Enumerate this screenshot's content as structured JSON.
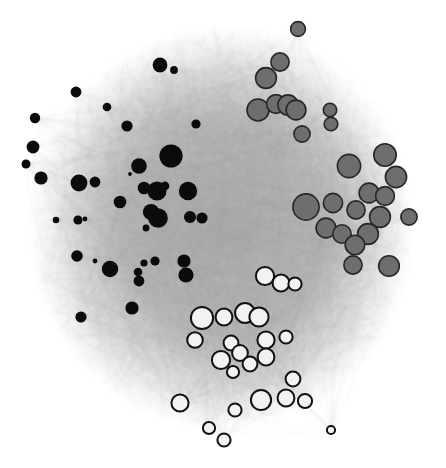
{
  "figure": {
    "title": "",
    "type": "network-graph",
    "width": 446,
    "height": 468,
    "background_color": "#ffffff"
  },
  "chart_data": {
    "type": "scatter",
    "title": "",
    "subtitle": "",
    "xlabel": "",
    "ylabel": "",
    "grid": false,
    "legend_position": "none",
    "xlim": [
      0,
      446
    ],
    "ylim": [
      0,
      468
    ],
    "layout": "force-directed",
    "communities": [
      {
        "id": "black",
        "name": "Community A",
        "fill": "#0b0b0b",
        "stroke": "#0b0b0b",
        "stroke_width": 0,
        "node_count": 52,
        "region": "left"
      },
      {
        "id": "gray",
        "name": "Community B",
        "fill": "#6e6e6e",
        "stroke": "#262626",
        "stroke_width": 1.6,
        "node_count": 36,
        "region": "upper-right"
      },
      {
        "id": "white",
        "name": "Community C",
        "fill": "#f2f2f2",
        "stroke": "#111111",
        "stroke_width": 2,
        "node_count": 40,
        "region": "bottom"
      }
    ],
    "edges": {
      "color": "#9a9a9a",
      "opacity": 0.1,
      "width": 0.45,
      "count": 2400,
      "style": "curved-arcs",
      "core_density_color": "#b2b2b2"
    },
    "nodes": [
      {
        "x": 160,
        "y": 65,
        "r": 7.4,
        "g": "black"
      },
      {
        "x": 174,
        "y": 70,
        "r": 3.9,
        "g": "black"
      },
      {
        "x": 76,
        "y": 92,
        "r": 5.4,
        "g": "black"
      },
      {
        "x": 35,
        "y": 118,
        "r": 5.2,
        "g": "black"
      },
      {
        "x": 107,
        "y": 107,
        "r": 4.3,
        "g": "black"
      },
      {
        "x": 127,
        "y": 126,
        "r": 5.6,
        "g": "black"
      },
      {
        "x": 196,
        "y": 124,
        "r": 4.6,
        "g": "black"
      },
      {
        "x": 33,
        "y": 147,
        "r": 6.4,
        "g": "black"
      },
      {
        "x": 26,
        "y": 164,
        "r": 4.5,
        "g": "black"
      },
      {
        "x": 171,
        "y": 156,
        "r": 11.6,
        "g": "black"
      },
      {
        "x": 139,
        "y": 166,
        "r": 7.8,
        "g": "black"
      },
      {
        "x": 130,
        "y": 174,
        "r": 1.9,
        "g": "black"
      },
      {
        "x": 41,
        "y": 178,
        "r": 6.6,
        "g": "black"
      },
      {
        "x": 79,
        "y": 183,
        "r": 8.4,
        "g": "black"
      },
      {
        "x": 95,
        "y": 182,
        "r": 5.4,
        "g": "black"
      },
      {
        "x": 144,
        "y": 188,
        "r": 6.3,
        "g": "black"
      },
      {
        "x": 157,
        "y": 191,
        "r": 9.6,
        "g": "black"
      },
      {
        "x": 165,
        "y": 186,
        "r": 4.4,
        "g": "black"
      },
      {
        "x": 188,
        "y": 191,
        "r": 9.2,
        "g": "black"
      },
      {
        "x": 120,
        "y": 202,
        "r": 6.3,
        "g": "black"
      },
      {
        "x": 151,
        "y": 212,
        "r": 8.1,
        "g": "black"
      },
      {
        "x": 158,
        "y": 218,
        "r": 9.8,
        "g": "black"
      },
      {
        "x": 190,
        "y": 217,
        "r": 6.0,
        "g": "black"
      },
      {
        "x": 202,
        "y": 218,
        "r": 5.6,
        "g": "black"
      },
      {
        "x": 56,
        "y": 220,
        "r": 3.3,
        "g": "black"
      },
      {
        "x": 78,
        "y": 220,
        "r": 4.6,
        "g": "black"
      },
      {
        "x": 85,
        "y": 219,
        "r": 2.4,
        "g": "black"
      },
      {
        "x": 146,
        "y": 228,
        "r": 3.4,
        "g": "black"
      },
      {
        "x": 77,
        "y": 256,
        "r": 5.8,
        "g": "black"
      },
      {
        "x": 95,
        "y": 261,
        "r": 2.4,
        "g": "black"
      },
      {
        "x": 110,
        "y": 269,
        "r": 8.2,
        "g": "black"
      },
      {
        "x": 138,
        "y": 272,
        "r": 4.3,
        "g": "black"
      },
      {
        "x": 144,
        "y": 263,
        "r": 3.6,
        "g": "black"
      },
      {
        "x": 155,
        "y": 261,
        "r": 4.6,
        "g": "black"
      },
      {
        "x": 139,
        "y": 281,
        "r": 5.4,
        "g": "black"
      },
      {
        "x": 184,
        "y": 261,
        "r": 6.6,
        "g": "black"
      },
      {
        "x": 186,
        "y": 275,
        "r": 7.6,
        "g": "black"
      },
      {
        "x": 132,
        "y": 308,
        "r": 6.6,
        "g": "black"
      },
      {
        "x": 81,
        "y": 317,
        "r": 5.6,
        "g": "black"
      },
      {
        "x": 298,
        "y": 29,
        "r": 7.4,
        "g": "gray"
      },
      {
        "x": 280,
        "y": 62,
        "r": 9.1,
        "g": "gray"
      },
      {
        "x": 266,
        "y": 78,
        "r": 10.4,
        "g": "gray"
      },
      {
        "x": 258,
        "y": 110,
        "r": 11.0,
        "g": "gray"
      },
      {
        "x": 276,
        "y": 104,
        "r": 9.4,
        "g": "gray"
      },
      {
        "x": 288,
        "y": 105,
        "r": 10.1,
        "g": "gray"
      },
      {
        "x": 296,
        "y": 110,
        "r": 9.9,
        "g": "gray"
      },
      {
        "x": 330,
        "y": 110,
        "r": 6.7,
        "g": "gray"
      },
      {
        "x": 331,
        "y": 124,
        "r": 6.8,
        "g": "gray"
      },
      {
        "x": 302,
        "y": 134,
        "r": 8.1,
        "g": "gray"
      },
      {
        "x": 385,
        "y": 155,
        "r": 11.2,
        "g": "gray"
      },
      {
        "x": 349,
        "y": 166,
        "r": 11.6,
        "g": "gray"
      },
      {
        "x": 396,
        "y": 177,
        "r": 10.6,
        "g": "gray"
      },
      {
        "x": 369,
        "y": 193,
        "r": 9.9,
        "g": "gray"
      },
      {
        "x": 385,
        "y": 196,
        "r": 9.4,
        "g": "gray"
      },
      {
        "x": 306,
        "y": 207,
        "r": 13.1,
        "g": "gray"
      },
      {
        "x": 333,
        "y": 203,
        "r": 9.6,
        "g": "gray"
      },
      {
        "x": 356,
        "y": 210,
        "r": 9.1,
        "g": "gray"
      },
      {
        "x": 380,
        "y": 217,
        "r": 10.4,
        "g": "gray"
      },
      {
        "x": 409,
        "y": 217,
        "r": 8.1,
        "g": "gray"
      },
      {
        "x": 326,
        "y": 228,
        "r": 9.9,
        "g": "gray"
      },
      {
        "x": 342,
        "y": 234,
        "r": 9.2,
        "g": "gray"
      },
      {
        "x": 368,
        "y": 234,
        "r": 10.4,
        "g": "gray"
      },
      {
        "x": 355,
        "y": 245,
        "r": 9.8,
        "g": "gray"
      },
      {
        "x": 353,
        "y": 265,
        "r": 9.1,
        "g": "gray"
      },
      {
        "x": 389,
        "y": 266,
        "r": 10.3,
        "g": "gray"
      },
      {
        "x": 265,
        "y": 276,
        "r": 9.1,
        "g": "white"
      },
      {
        "x": 281,
        "y": 283,
        "r": 8.4,
        "g": "white"
      },
      {
        "x": 295,
        "y": 284,
        "r": 6.6,
        "g": "white"
      },
      {
        "x": 202,
        "y": 318,
        "r": 11.1,
        "g": "white"
      },
      {
        "x": 224,
        "y": 317,
        "r": 8.4,
        "g": "white"
      },
      {
        "x": 245,
        "y": 313,
        "r": 9.9,
        "g": "white"
      },
      {
        "x": 259,
        "y": 317,
        "r": 9.6,
        "g": "white"
      },
      {
        "x": 195,
        "y": 340,
        "r": 7.8,
        "g": "white"
      },
      {
        "x": 231,
        "y": 343,
        "r": 7.4,
        "g": "white"
      },
      {
        "x": 266,
        "y": 340,
        "r": 8.6,
        "g": "white"
      },
      {
        "x": 286,
        "y": 337,
        "r": 6.6,
        "g": "white"
      },
      {
        "x": 221,
        "y": 360,
        "r": 9.1,
        "g": "white"
      },
      {
        "x": 240,
        "y": 353,
        "r": 7.9,
        "g": "white"
      },
      {
        "x": 250,
        "y": 364,
        "r": 7.4,
        "g": "white"
      },
      {
        "x": 266,
        "y": 357,
        "r": 8.4,
        "g": "white"
      },
      {
        "x": 233,
        "y": 372,
        "r": 6.1,
        "g": "white"
      },
      {
        "x": 293,
        "y": 379,
        "r": 7.4,
        "g": "white"
      },
      {
        "x": 180,
        "y": 403,
        "r": 8.6,
        "g": "white"
      },
      {
        "x": 261,
        "y": 400,
        "r": 10.1,
        "g": "white"
      },
      {
        "x": 286,
        "y": 398,
        "r": 8.4,
        "g": "white"
      },
      {
        "x": 305,
        "y": 401,
        "r": 7.1,
        "g": "white"
      },
      {
        "x": 235,
        "y": 410,
        "r": 6.6,
        "g": "white"
      },
      {
        "x": 209,
        "y": 428,
        "r": 6.1,
        "g": "white"
      },
      {
        "x": 224,
        "y": 440,
        "r": 6.6,
        "g": "white"
      },
      {
        "x": 331,
        "y": 430,
        "r": 4.1,
        "g": "white"
      }
    ]
  }
}
